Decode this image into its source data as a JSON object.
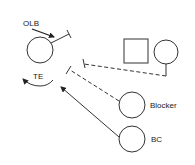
{
  "diagram": {
    "type": "football-play",
    "labels": {
      "olb": "OLB",
      "te": "TE",
      "blocker": "Blocker",
      "bc": "BC"
    },
    "players": [
      {
        "id": "olb",
        "shape": "circle",
        "label": "OLB"
      },
      {
        "id": "te",
        "shape": "none",
        "label": "TE"
      },
      {
        "id": "square-player",
        "shape": "square",
        "label": ""
      },
      {
        "id": "right-player",
        "shape": "circle",
        "label": ""
      },
      {
        "id": "blocker",
        "shape": "circle",
        "label": "Blocker"
      },
      {
        "id": "bc",
        "shape": "circle",
        "label": "BC"
      }
    ],
    "colors": {
      "stroke": "#333333",
      "background": "#ffffff"
    }
  }
}
